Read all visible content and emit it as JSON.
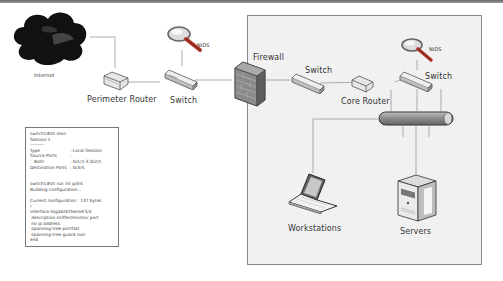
{
  "diagram": {
    "nodes": {
      "internet": {
        "label": "Internet"
      },
      "perimeter_router": {
        "label": "Perimeter Router"
      },
      "switch_outer": {
        "label": "Switch"
      },
      "nids_outer": {
        "label": "NIDS"
      },
      "firewall": {
        "label": "Firewall"
      },
      "switch_inner": {
        "label": "Switch"
      },
      "core_router": {
        "label": "Core Router"
      },
      "switch_core": {
        "label": "Switch"
      },
      "nids_inner": {
        "label": "NIDS"
      },
      "workstations": {
        "label": "Workstations"
      },
      "servers": {
        "label": "Servers"
      }
    },
    "colors": {
      "zone_bg": "#f1f1f1",
      "zone_border": "#8a8a8a",
      "wire": "#999999",
      "bus": "#8d8d8d",
      "magnifier_handle": "#b23c2a"
    }
  },
  "config_box": {
    "lines": [
      {
        "text": "switch1#sh mon"
      },
      {
        "text": "Session 1"
      },
      {
        "text": "---------"
      },
      {
        "key": "Type",
        "value": ": Local Session"
      },
      {
        "key": "Source Ports",
        "value": ":"
      },
      {
        "key": "   Both",
        "value": ": Gi1/1-3,Gi2/1"
      },
      {
        "key": "Destination Ports",
        "value": ": Gi3/4"
      },
      {
        "text": ""
      },
      {
        "text": "switch1#sh run int gi3/4"
      },
      {
        "text": "Building configuration..."
      },
      {
        "text": ""
      },
      {
        "text": "Current configuration : 137 bytes"
      },
      {
        "text": "!"
      },
      {
        "text": "interface GigabitEthernet3/4"
      },
      {
        "text": " description sniffer/monitor port"
      },
      {
        "text": " no ip address"
      },
      {
        "text": " spanning-tree portfast"
      },
      {
        "text": " spanning-tree guard root"
      },
      {
        "text": "end"
      }
    ]
  }
}
